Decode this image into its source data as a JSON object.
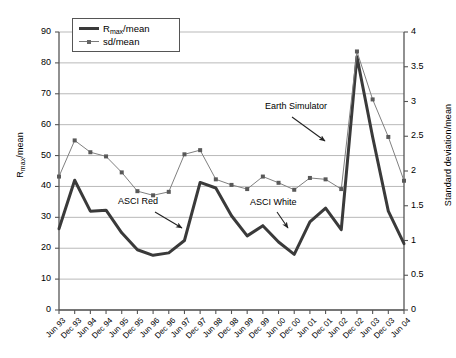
{
  "chart_data": {
    "type": "line",
    "title": "",
    "xlabel": "",
    "ylabel": "Rmax/mean",
    "ylabel_right": "Standard deviation/mean",
    "grid": true,
    "legend_position": "top-left-inside",
    "categories": [
      "Jun 93",
      "Dec 93",
      "Jun 94",
      "Dec 94",
      "Jun 95",
      "Dec 95",
      "Jun 96",
      "Dec 96",
      "Jun 97",
      "Dec 97",
      "Jun 98",
      "Dec 98",
      "Jun 99",
      "Dec 99",
      "Jun 00",
      "Dec 00",
      "Jun 01",
      "Dec 01",
      "Jun 02",
      "Dec 02",
      "Jun 03",
      "Dec 03",
      "Jun 04"
    ],
    "ylim": [
      0,
      90
    ],
    "yticks": [
      0,
      10,
      20,
      30,
      40,
      50,
      60,
      70,
      80,
      90
    ],
    "ylim_right": [
      0,
      4
    ],
    "yticks_right": [
      0,
      0.5,
      1,
      1.5,
      2,
      2.5,
      3,
      3.5,
      4
    ],
    "series": [
      {
        "name": "Rmax/mean",
        "axis": "left",
        "color": "#3a3a3a",
        "marker": "none",
        "values": [
          26.3,
          42.0,
          32.0,
          32.3,
          25.0,
          19.5,
          17.7,
          18.5,
          22.5,
          41.3,
          39.5,
          30.5,
          24.0,
          27.3,
          22.0,
          18.0,
          28.5,
          33.0,
          26.0,
          82.0,
          56.0,
          32.0,
          21.5
        ]
      },
      {
        "name": "sd/mean",
        "axis": "right",
        "color": "#7f7f7f",
        "marker": "square",
        "values": [
          1.92,
          2.44,
          2.27,
          2.21,
          1.98,
          1.71,
          1.65,
          1.7,
          2.24,
          2.3,
          1.88,
          1.8,
          1.74,
          1.92,
          1.83,
          1.73,
          1.9,
          1.88,
          1.74,
          3.72,
          3.03,
          2.49,
          1.86
        ]
      }
    ],
    "annotations": [
      {
        "id": "asci-red",
        "text": "ASCI Red",
        "text_x": 118,
        "text_y": 196,
        "arrow": {
          "x1": 155,
          "y1": 212,
          "x2": 182,
          "y2": 228
        }
      },
      {
        "id": "asci-white",
        "text": "ASCI White",
        "text_x": 250,
        "text_y": 197,
        "arrow": {
          "x1": 277,
          "y1": 212,
          "x2": 288,
          "y2": 228
        }
      },
      {
        "id": "earth-simulator",
        "text": "Earth Simulator",
        "text_x": 265,
        "text_y": 101,
        "arrow": {
          "x1": 292,
          "y1": 117,
          "x2": 325,
          "y2": 141
        }
      }
    ]
  },
  "legend": {
    "items": [
      {
        "label_prefix": "R",
        "label_sub": "max",
        "label_suffix": "/mean",
        "key": "thick-line"
      },
      {
        "label_prefix": "sd/mean",
        "label_sub": "",
        "label_suffix": "",
        "key": "thin-line-marker"
      }
    ]
  },
  "axes": {
    "left_title": "Rmax/mean",
    "right_title": "Standard deviation/mean"
  }
}
